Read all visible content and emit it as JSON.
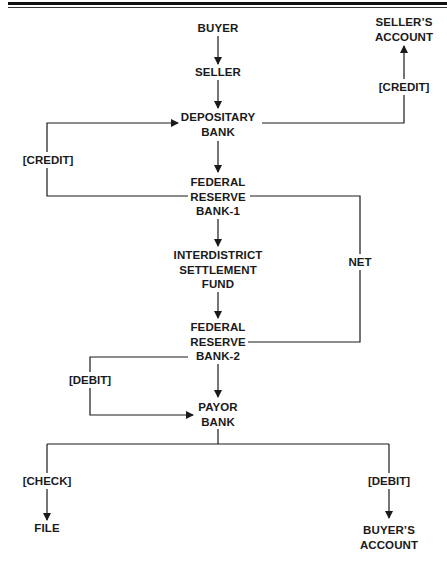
{
  "diagram": {
    "type": "flowchart",
    "nodes": {
      "buyer": {
        "lines": [
          "BUYER"
        ]
      },
      "seller": {
        "lines": [
          "SELLER"
        ]
      },
      "depositary_bank": {
        "lines": [
          "DEPOSITARY",
          "BANK"
        ]
      },
      "federal_reserve_bank_1": {
        "lines": [
          "FEDERAL",
          "RESERVE",
          "BANK-1"
        ]
      },
      "interdistrict_settlement_fund": {
        "lines": [
          "INTERDISTRICT",
          "SETTLEMENT",
          "FUND"
        ]
      },
      "federal_reserve_bank_2": {
        "lines": [
          "FEDERAL",
          "RESERVE",
          "BANK-2"
        ]
      },
      "payor_bank": {
        "lines": [
          "PAYOR",
          "BANK"
        ]
      },
      "sellers_account": {
        "lines": [
          "SELLER’S",
          "ACCOUNT"
        ]
      },
      "file": {
        "lines": [
          "FILE"
        ]
      },
      "buyers_account": {
        "lines": [
          "BUYER’S",
          "ACCOUNT"
        ]
      }
    },
    "edge_labels": {
      "credit_sellers_account": "[CREDIT]",
      "credit_depositary": "[CREDIT]",
      "net": "NET",
      "debit_payor": "[DEBIT]",
      "check": "[CHECK]",
      "debit_buyers_account": "[DEBIT]"
    },
    "edges": [
      {
        "from": "BUYER",
        "to": "SELLER",
        "label": ""
      },
      {
        "from": "SELLER",
        "to": "DEPOSITARY BANK",
        "label": ""
      },
      {
        "from": "DEPOSITARY BANK",
        "to": "SELLER'S ACCOUNT",
        "label": "[CREDIT]"
      },
      {
        "from": "DEPOSITARY BANK",
        "to": "FEDERAL RESERVE BANK-1",
        "label": ""
      },
      {
        "from": "FEDERAL RESERVE BANK-1",
        "to": "DEPOSITARY BANK",
        "label": "[CREDIT]"
      },
      {
        "from": "FEDERAL RESERVE BANK-1",
        "to": "INTERDISTRICT SETTLEMENT FUND",
        "label": ""
      },
      {
        "from": "FEDERAL RESERVE BANK-1",
        "to": "FEDERAL RESERVE BANK-2",
        "label": "NET"
      },
      {
        "from": "INTERDISTRICT SETTLEMENT FUND",
        "to": "FEDERAL RESERVE BANK-2",
        "label": ""
      },
      {
        "from": "FEDERAL RESERVE BANK-2",
        "to": "PAYOR BANK",
        "label": ""
      },
      {
        "from": "FEDERAL RESERVE BANK-2",
        "to": "PAYOR BANK",
        "label": "[DEBIT]"
      },
      {
        "from": "PAYOR BANK",
        "to": "FILE",
        "label": "[CHECK]"
      },
      {
        "from": "PAYOR BANK",
        "to": "BUYER'S ACCOUNT",
        "label": "[DEBIT]"
      }
    ],
    "colors": {
      "line": "#1a1a1a",
      "text": "#1a1a1a",
      "background": "#ffffff"
    }
  }
}
